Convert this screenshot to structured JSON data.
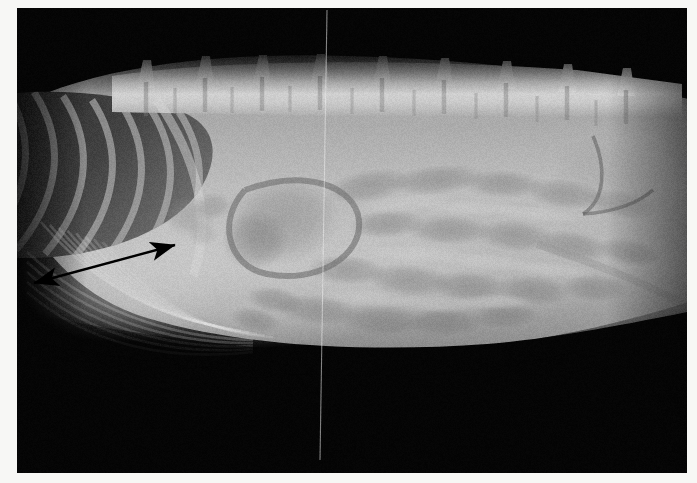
{
  "image": {
    "kind": "radiograph",
    "modality": "X-ray",
    "view": "right lateral",
    "body_region": "abdomen",
    "species_hint": "small animal (canine/feline)",
    "plate": {
      "x": 17,
      "y": 8,
      "width": 670,
      "height": 465
    },
    "border_color": "#f7f7f5",
    "background_color": "#050505",
    "canvas_size": {
      "width": 697,
      "height": 483
    }
  },
  "tones": {
    "film_black": "#050505",
    "lung_dark": "#3a3a3a",
    "soft_tissue_mid": "#8e8e8e",
    "fat_light": "#b9b9b9",
    "bone_bright": "#d8d8d8",
    "bone_brightest": "#eeeeee",
    "gas_dark": "#636363",
    "annotation_color": "#000000"
  },
  "annotations": [
    {
      "name": "double-headed-measure-arrow",
      "type": "double-arrow",
      "color": "#000000",
      "shaft_width": 2.4,
      "head_length": 17,
      "head_width": 12,
      "x1": 34,
      "y1": 283,
      "x2": 175,
      "y2": 245,
      "label": ""
    }
  ],
  "artifacts": [
    {
      "name": "vertical-grid-line",
      "type": "thin-bright-line",
      "x_top": 327,
      "x_bottom": 320,
      "y_top": 10,
      "y_bottom": 460,
      "color": "rgba(235,235,235,0.55)",
      "width": 1.1
    }
  ],
  "anatomy": {
    "spine": {
      "name": "lumbar-vertebral-column",
      "vertebra_count": 8,
      "dorsal_edge_y": 72,
      "body_height": 34,
      "spinous_processes": [
        {
          "x": 146,
          "y": 62
        },
        {
          "x": 205,
          "y": 58
        },
        {
          "x": 262,
          "y": 57
        },
        {
          "x": 320,
          "y": 56
        },
        {
          "x": 382,
          "y": 58
        },
        {
          "x": 444,
          "y": 60
        },
        {
          "x": 506,
          "y": 63
        },
        {
          "x": 567,
          "y": 66
        },
        {
          "x": 626,
          "y": 70
        }
      ]
    },
    "thorax": {
      "name": "caudal-thorax-lung-field",
      "description": "dark aerated lung with rib shadows, cranio-dorsal left of frame",
      "region": {
        "x": 18,
        "y": 95,
        "width": 190,
        "height": 150
      }
    },
    "diaphragm": {
      "name": "diaphragm-liver-interface",
      "description": "curved soft tissue border sweeping caudo-ventrally"
    },
    "stomach": {
      "name": "stomach-gas-cap",
      "region": {
        "x": 215,
        "y": 175,
        "width": 120,
        "height": 95
      }
    },
    "bowel": {
      "name": "gas-filled-intestinal-loops",
      "region": {
        "x": 300,
        "y": 170,
        "width": 260,
        "height": 170
      }
    },
    "caudal_abdomen": {
      "name": "caudal-abdomen-pelvic-inlet",
      "region": {
        "x": 540,
        "y": 130,
        "width": 140,
        "height": 180
      }
    },
    "ventral_wall": {
      "name": "ventral-abdominal-wall-contour",
      "description": "bright falciform fat band with costal arch shadows"
    }
  }
}
